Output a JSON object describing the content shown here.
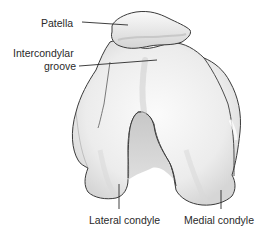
{
  "figure": {
    "labels": {
      "patella": "Patella",
      "intercondylar_groove_line1": "Intercondylar",
      "intercondylar_groove_line2": "groove",
      "lateral_condyle": "Lateral condyle",
      "medial_condyle": "Medial condyle"
    },
    "colors": {
      "outline": "#3a3a3a",
      "bone_fill": "#f2f2f2",
      "shadow": "#c8c8c8",
      "leader_line": "#2a2a2a",
      "text": "#2a2a2a",
      "background": "#ffffff"
    }
  }
}
